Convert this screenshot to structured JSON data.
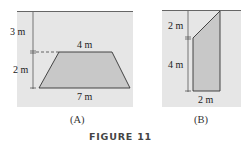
{
  "figure": {
    "title": "FIGURE 11",
    "panels": [
      {
        "caption": "(A)",
        "shape": "trapezoid",
        "labels": {
          "depth_to_top": "3 m",
          "height": "2 m",
          "top_width": "4 m",
          "bottom_width": "7 m"
        }
      },
      {
        "caption": "(B)",
        "shape": "trapezoid-vertical",
        "labels": {
          "top_slope_height": "2 m",
          "vertical_side": "4 m",
          "bottom_width": "2 m"
        }
      }
    ],
    "colors": {
      "water": "#e6e6e6",
      "plate": "#c8c8c8",
      "line": "#333333"
    }
  }
}
